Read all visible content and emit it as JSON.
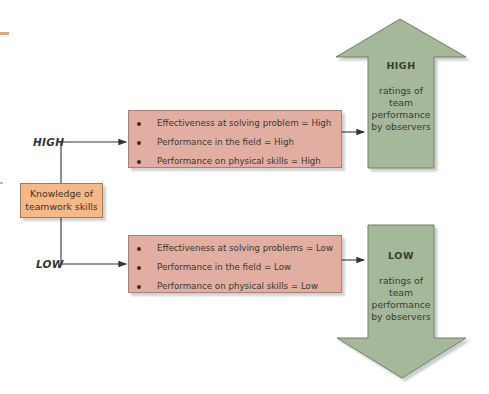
{
  "diagram": {
    "predictor": {
      "label_line1": "Knowledge of",
      "label_line2": "teamwork skills",
      "color": "#f6b887"
    },
    "branches": [
      {
        "level_label": "HIGH",
        "outcomes": [
          "Effectiveness at solving problem = High",
          "Performance in the field = High",
          "Performance on physical skills = High"
        ],
        "result": {
          "level": "HIGH",
          "direction": "up",
          "line1": "ratings of",
          "line2": "team",
          "line3": "performance",
          "line4": "by observers"
        }
      },
      {
        "level_label": "LOW",
        "outcomes": [
          "Effectiveness at solving problems = Low",
          "Performance in the field = Low",
          "Performance on physical skills = Low"
        ],
        "result": {
          "level": "LOW",
          "direction": "down",
          "line1": "ratings of",
          "line2": "team",
          "line3": "performance",
          "line4": "by observers"
        }
      }
    ],
    "colors": {
      "outcome_box": "#e3aea2",
      "result_arrow": "#a6b89a",
      "connector": "#333333"
    }
  }
}
